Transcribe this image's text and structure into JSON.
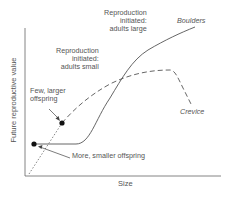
{
  "diagram": {
    "axes": {
      "x_label": "Size",
      "y_label": "Future reproductive value"
    },
    "curves": [
      {
        "name": "Boulders",
        "style": "solid",
        "color": "#555555"
      },
      {
        "name": "Crevice",
        "style": "dashed",
        "color": "#555555"
      }
    ],
    "annotations": {
      "boulders_label": "Boulders",
      "crevice_label": "Crevice",
      "repro_large": [
        "Reproduction",
        "initiated:",
        "adults large"
      ],
      "repro_small": [
        "Reproduction",
        "initiated:",
        "adults small"
      ],
      "few_larger": [
        "Few, larger",
        "offspring"
      ],
      "more_smaller": "More, smaller offspring"
    },
    "points": [
      {
        "name": "more-smaller-offspring-point",
        "x": 34,
        "y": 144
      },
      {
        "name": "few-larger-offspring-point",
        "x": 62,
        "y": 123
      }
    ]
  }
}
